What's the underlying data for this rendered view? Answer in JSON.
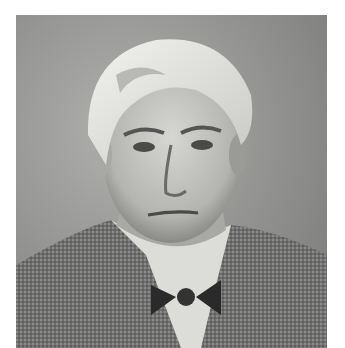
{
  "image": {
    "type": "photograph",
    "description": "Black-and-white portrait of an older man with swept white hair, wearing a tweed jacket, white shirt, and dark bow tie",
    "colors": {
      "background": "#ffffff",
      "backdrop": "#9a9a98",
      "hair": "#e6e6e2",
      "skin": "#c9c9c5",
      "shadow": "#5a5a58",
      "jacket": "#6e6e6c",
      "shirt": "#dcdcd8",
      "bowtie": "#2a2a2a"
    }
  }
}
